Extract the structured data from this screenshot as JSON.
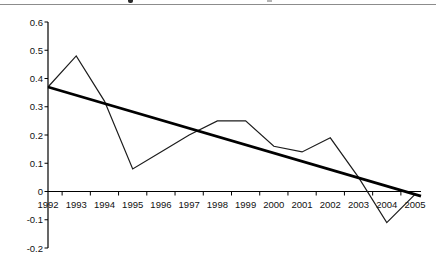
{
  "chart_data": {
    "type": "line",
    "title": "",
    "xlabel": "",
    "ylabel": "",
    "categories": [
      "1992",
      "1993",
      "1994",
      "1995",
      "1996",
      "1997",
      "1998",
      "1999",
      "2000",
      "2001",
      "2002",
      "2003",
      "2004",
      "2005"
    ],
    "series": [
      {
        "name": "observed-series",
        "style": "thin",
        "values": [
          0.37,
          0.48,
          0.32,
          0.08,
          0.14,
          0.2,
          0.25,
          0.25,
          0.16,
          0.14,
          0.19,
          0.05,
          -0.11,
          -0.01
        ]
      },
      {
        "name": "linear-trend",
        "style": "thick",
        "start": 0.37,
        "end": -0.01
      }
    ],
    "ylim": [
      -0.2,
      0.6
    ],
    "ytick_step": 0.1,
    "y_tick_labels": [
      "0.6",
      "0.5",
      "0.4",
      "0.3",
      "0.2",
      "0.1",
      "0",
      "-0.1",
      "-0.2"
    ],
    "grid": false,
    "legend": "none"
  },
  "colors": {
    "series_line": "#1c1c1c",
    "trend_line": "#000000",
    "axis": "#000000",
    "top_rule": "#8c8c8c"
  }
}
